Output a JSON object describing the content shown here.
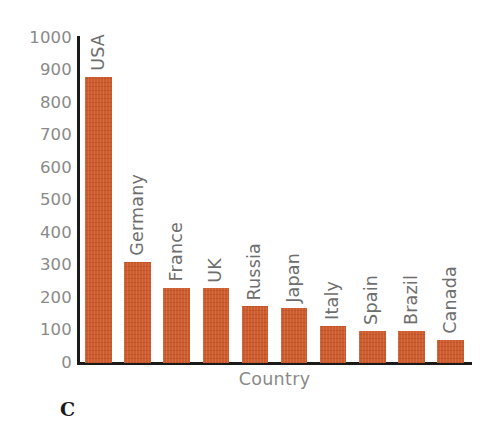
{
  "panel": {
    "label": "C"
  },
  "colors": {
    "bar": "#cb5526",
    "axis": "#1a1a1a",
    "tick_text": "#8a8a8a",
    "background": "#ffffff"
  },
  "chart_data": {
    "type": "bar",
    "title": "",
    "xlabel": "Country",
    "ylabel": "",
    "categories": [
      "USA",
      "Germany",
      "France",
      "UK",
      "Russia",
      "Japan",
      "Italy",
      "Spain",
      "Brazil",
      "Canada"
    ],
    "values": [
      880,
      310,
      232,
      230,
      175,
      168,
      115,
      100,
      98,
      72
    ],
    "ylim": [
      0,
      1000
    ],
    "ytick_labels": [
      "1000",
      "900",
      "800",
      "700",
      "600",
      "500",
      "400",
      "300",
      "200",
      "100",
      "0"
    ],
    "ytick_values": [
      1000,
      900,
      800,
      700,
      600,
      500,
      400,
      300,
      200,
      100,
      0
    ],
    "ytick_step": 100,
    "grid": false,
    "legend": false,
    "legend_position": "none",
    "bar_label_rotation": 90,
    "bar_label_position": "above-bar",
    "series": [
      {
        "name": "Country values",
        "values": [
          880,
          310,
          232,
          230,
          175,
          168,
          115,
          100,
          98,
          72
        ]
      }
    ]
  }
}
